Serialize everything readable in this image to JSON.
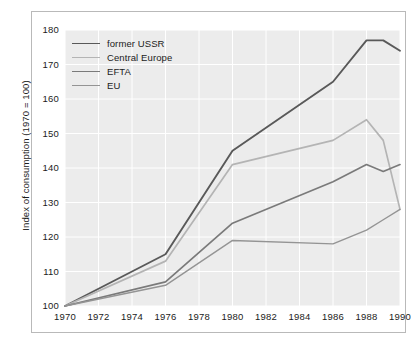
{
  "chart_data": {
    "type": "line",
    "title": "",
    "subtitle": "",
    "xlabel": "",
    "ylabel": "Index of consumption (1970 = 100)",
    "xlim": [
      1970,
      1990
    ],
    "ylim": [
      100,
      180
    ],
    "ytick_labels": [
      "180",
      "170",
      "160",
      "150",
      "140",
      "130",
      "120",
      "110",
      "100"
    ],
    "ytick_values": [
      180,
      170,
      160,
      150,
      140,
      130,
      120,
      110,
      100
    ],
    "xtick_labels": [
      "1970",
      "1972",
      "1974",
      "1976",
      "1978",
      "1980",
      "1982",
      "1984",
      "1986",
      "1988",
      "1990"
    ],
    "xtick_values": [
      1970,
      1972,
      1974,
      1976,
      1978,
      1980,
      1982,
      1984,
      1986,
      1988,
      1990
    ],
    "grid": true,
    "grid_color": "#ffffff",
    "plot_background": "#ececec",
    "legend_position": "top-left",
    "x": [
      1970,
      1976,
      1980,
      1986,
      1988,
      1989,
      1990
    ],
    "series": [
      {
        "name": "former USSR",
        "color": "#595959",
        "width": 1.9,
        "values": [
          100,
          115,
          145,
          165,
          177,
          177,
          174
        ]
      },
      {
        "name": "Central Europe",
        "color": "#b4b4b4",
        "width": 1.7,
        "values": [
          100,
          113,
          141,
          148,
          154,
          148,
          128
        ]
      },
      {
        "name": "EFTA",
        "color": "#7a7a7a",
        "width": 1.7,
        "values": [
          100,
          107,
          124,
          136,
          141,
          139,
          141
        ]
      },
      {
        "name": "EU",
        "color": "#949494",
        "width": 1.4,
        "values": [
          100,
          106,
          119,
          118,
          122,
          125,
          128
        ]
      }
    ]
  },
  "legend": {
    "items": [
      {
        "label": "former USSR"
      },
      {
        "label": "Central Europe"
      },
      {
        "label": "EFTA"
      },
      {
        "label": "EU"
      }
    ]
  },
  "axes": {
    "y_title": "Index of consumption (1970 = 100)"
  }
}
